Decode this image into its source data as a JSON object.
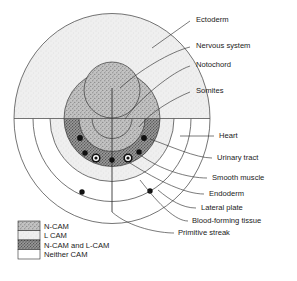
{
  "figure": {
    "type": "schematic-diagram"
  },
  "colors": {
    "ncam_fill": "#b9b9b9",
    "lcam_fill": "#ededed",
    "both_fill": "#8e8e8e",
    "neither_fill": "#ffffff",
    "outline": "#3a3a3a",
    "leader": "#333333",
    "text": "#1a1a1a",
    "dot_dark": "#111111",
    "dot_ring": "#ffffff",
    "background": "#ffffff"
  },
  "labels": [
    {
      "id": "ectoderm",
      "text": "Ectoderm",
      "x": 196,
      "y": 20
    },
    {
      "id": "nervous-system",
      "text": "Nervous system",
      "x": 196,
      "y": 46
    },
    {
      "id": "notochord",
      "text": "Notochord",
      "x": 196,
      "y": 65
    },
    {
      "id": "somites",
      "text": "Somites",
      "x": 196,
      "y": 91
    },
    {
      "id": "heart",
      "text": "Heart",
      "x": 219,
      "y": 136
    },
    {
      "id": "urinary-tract",
      "text": "Urinary tract",
      "x": 217,
      "y": 158
    },
    {
      "id": "smooth-muscle",
      "text": "Smooth muscle",
      "x": 212,
      "y": 178
    },
    {
      "id": "endoderm",
      "text": "Endoderm",
      "x": 209,
      "y": 194
    },
    {
      "id": "lateral-plate",
      "text": "Lateral plate",
      "x": 201,
      "y": 208
    },
    {
      "id": "blood-forming-tissue",
      "text": "Blood-forming tissue",
      "x": 192,
      "y": 221
    },
    {
      "id": "primitive-streak",
      "text": "Primitive streak",
      "x": 178,
      "y": 233
    }
  ],
  "legend": {
    "items": [
      {
        "id": "n-cam",
        "label": "N-CAM",
        "pattern": "ncam-stipple",
        "fill": "#b9b9b9"
      },
      {
        "id": "l-cam",
        "label": "L CAM",
        "pattern": "lcam-light",
        "fill": "#ededed"
      },
      {
        "id": "n-cam-and-l-cam",
        "label": "N-CAM and L-CAM",
        "pattern": "both-dark",
        "fill": "#8e8e8e"
      },
      {
        "id": "neither-cam",
        "label": "Neither CAM",
        "pattern": "none",
        "fill": "#ffffff"
      }
    ],
    "box": {
      "x": 18,
      "y": 221,
      "width": 22,
      "height": 9.5
    }
  },
  "regions": [
    {
      "id": "ectoderm-dome",
      "cam": "L CAM",
      "shape": "upper-ellipse"
    },
    {
      "id": "neural-plate-dome",
      "cam": "N-CAM",
      "shape": "upper-inner-ellipse"
    },
    {
      "id": "notochord-circle",
      "cam": "N-CAM",
      "shape": "circle"
    },
    {
      "id": "somites-band",
      "cam": "N-CAM",
      "shape": "lower-semicircle"
    },
    {
      "id": "lateral-plate-band",
      "cam": "L CAM",
      "shape": "lower-semicircle"
    },
    {
      "id": "endoderm-band",
      "cam": "Neither CAM",
      "shape": "lower-semicircle"
    }
  ],
  "markers": {
    "heart": 2,
    "urinary_tract": 2,
    "smooth_muscle": 2,
    "blood_forming_tissue": 3,
    "primitive_streak": 1
  }
}
